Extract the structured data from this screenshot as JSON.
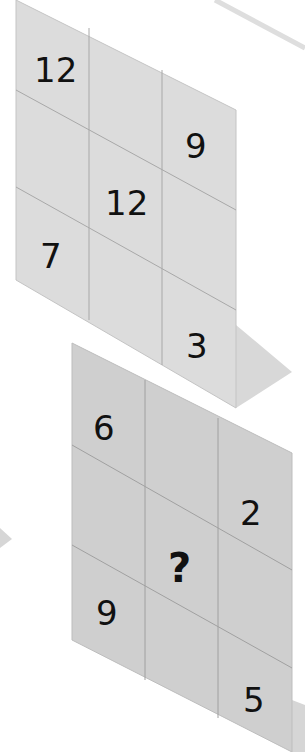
{
  "puzzle": {
    "top_grid": {
      "cells": [
        [
          "12",
          "",
          ""
        ],
        [
          "",
          "12",
          "9"
        ],
        [
          "7",
          "",
          "3"
        ]
      ],
      "fill_color": "#dcdcdc"
    },
    "bottom_grid": {
      "cells": [
        [
          "6",
          "",
          ""
        ],
        [
          "",
          "?",
          "2"
        ],
        [
          "9",
          "",
          "5"
        ]
      ],
      "fill_color": "#cfcfcf"
    },
    "colors": {
      "grid_line": "#a8a8a8",
      "shadow": "#d6d6d6",
      "text": "#111111"
    }
  }
}
